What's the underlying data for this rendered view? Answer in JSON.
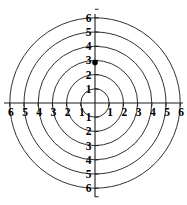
{
  "chart_data": {
    "type": "scatter",
    "title": "",
    "subtitle": "",
    "xlabel": "",
    "ylabel": "",
    "coordinate_system": "polar",
    "grid": true,
    "legend": false,
    "legend_position": "none",
    "xlim": [
      -6,
      6
    ],
    "ylim": [
      -6,
      6
    ],
    "radial_rings": [
      1,
      2,
      3,
      4,
      5,
      6
    ],
    "ring_count": 6,
    "x_tick_values": [
      -6,
      -5,
      -4,
      -3,
      -2,
      -1,
      1,
      2,
      3,
      4,
      5,
      6
    ],
    "y_tick_values": [
      -6,
      -5,
      -4,
      -3,
      -2,
      -1,
      1,
      2,
      3,
      4,
      5,
      6
    ],
    "x_tick_labels_left": [
      "6",
      "5",
      "4",
      "3",
      "2",
      "1"
    ],
    "x_tick_labels_right": [
      "1",
      "2",
      "3",
      "4",
      "5",
      "6"
    ],
    "y_tick_labels_up": [
      "1",
      "2",
      "3",
      "4",
      "5",
      "6"
    ],
    "y_tick_labels_down": [
      "1",
      "2",
      "3",
      "4",
      "5",
      "6"
    ],
    "series": [
      {
        "name": "point",
        "points": [
          {
            "x": 0,
            "y": 2.85,
            "r": 2.85,
            "theta_deg": 90,
            "label": ""
          }
        ],
        "color": "#000000",
        "marker": "filled-circle"
      }
    ],
    "axis_color": "#1a1a1a",
    "grid_color": "#1a1a1a",
    "background_color": "#ffffff"
  },
  "figure": {
    "center_x": 95,
    "center_y": 103,
    "unit_px": 14.2,
    "axis_half_length_px": 90
  }
}
